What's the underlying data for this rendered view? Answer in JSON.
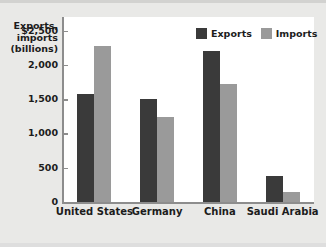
{
  "chart_data": {
    "type": "bar",
    "title": "",
    "ylabel": "Exports,\nimports\n(billions)",
    "xlabel": "",
    "categories": [
      "United States",
      "Germany",
      "China",
      "Saudi Arabia"
    ],
    "series": [
      {
        "name": "Exports",
        "color": "#3a3a3a",
        "values": [
          1580,
          1500,
          2210,
          380
        ]
      },
      {
        "name": "Imports",
        "color": "#9a9a9a",
        "values": [
          2270,
          1240,
          1720,
          150
        ]
      }
    ],
    "ylim": [
      0,
      2700
    ],
    "yticks": [
      0,
      500,
      1000,
      1500,
      2000,
      2500
    ],
    "ytick_labels": [
      "0",
      "500",
      "1,000",
      "1,500",
      "2,000",
      "$2,500"
    ],
    "grid": false,
    "legend_position": "top-right"
  },
  "axis": {
    "title": "Exports,\nimports\n(billions)",
    "tick_labels": [
      "$2,500",
      "2,000",
      "1,500",
      "1,000",
      "500",
      "0"
    ]
  },
  "legend": {
    "items": [
      {
        "label": "Exports",
        "color": "#3a3a3a"
      },
      {
        "label": "Imports",
        "color": "#9a9a9a"
      }
    ]
  },
  "categories": [
    {
      "label": "United States"
    },
    {
      "label": "Germany"
    },
    {
      "label": "China"
    },
    {
      "label": "Saudi Arabia"
    }
  ],
  "colors": {
    "exports": "#3a3a3a",
    "imports": "#9a9a9a",
    "background": "#e9e9e7",
    "plot_background": "#ffffff",
    "axis": "#8d8d8d",
    "text": "#1c1c1c"
  }
}
